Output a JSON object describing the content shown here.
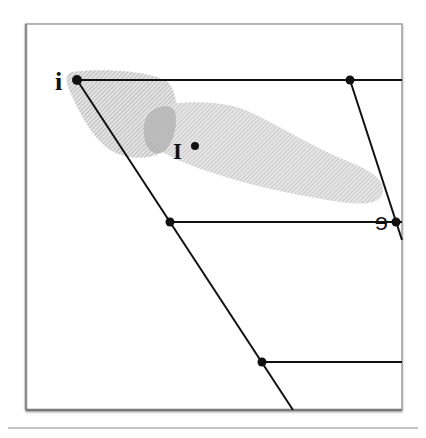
{
  "diagram": {
    "type": "vowel-chart",
    "colors": {
      "line": "#111111",
      "frame": "#9a9a9a",
      "shade": "#bdbdbd",
      "shade_overlap": "#9e9e9e",
      "separator": "#8a8a8a"
    },
    "labels": {
      "i": "i",
      "I": "I",
      "e": "e"
    },
    "points": [
      {
        "name": "i",
        "x": 77,
        "y": 80
      },
      {
        "name": "top-back",
        "x": 350,
        "y": 80
      },
      {
        "name": "mid-front",
        "x": 170,
        "y": 222
      },
      {
        "name": "e",
        "x": 396,
        "y": 222
      },
      {
        "name": "low-front",
        "x": 262,
        "y": 362
      },
      {
        "name": "I",
        "x": 195,
        "y": 146
      }
    ],
    "regions": [
      {
        "name": "i-region"
      },
      {
        "name": "I-region"
      }
    ]
  }
}
